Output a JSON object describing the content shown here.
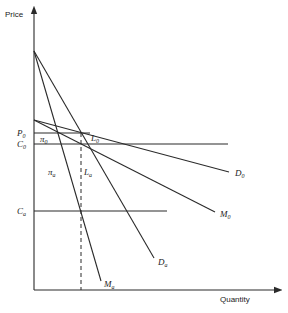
{
  "axes": {
    "y_label": "Price",
    "x_label": "Quantity"
  },
  "levels": {
    "P0": {
      "main": "P",
      "sub": "0"
    },
    "C0": {
      "main": "C",
      "sub": "0"
    },
    "Ca": {
      "main": "C",
      "sub": "a"
    }
  },
  "curves": {
    "D0": {
      "main": "D",
      "sub": "0"
    },
    "M0": {
      "main": "M",
      "sub": "0"
    },
    "Da": {
      "main": "D",
      "sub": "a"
    },
    "Ma": {
      "main": "M",
      "sub": "a"
    }
  },
  "regions": {
    "pi0": {
      "main": "π",
      "sub": "0"
    },
    "pia": {
      "main": "π",
      "sub": "a"
    },
    "L0": {
      "main": "L",
      "sub": "0"
    },
    "La": {
      "main": "L",
      "sub": "a"
    }
  }
}
